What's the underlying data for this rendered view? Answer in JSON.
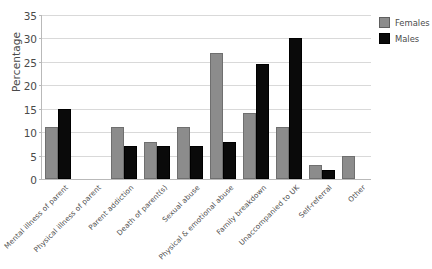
{
  "chart_data": {
    "type": "bar",
    "title": "",
    "xlabel": "",
    "ylabel": "Percentage",
    "ylim": [
      0,
      35
    ],
    "yticks": [
      0,
      5,
      10,
      15,
      20,
      25,
      30,
      35
    ],
    "grid": true,
    "legend_position": "right",
    "categories": [
      "Mental illness of parent",
      "Physical illness of parent",
      "Parent addiction",
      "Death of parent(s)",
      "Sexual abuse",
      "Physical & emotional abuse",
      "Family breakdown",
      "Unaccompanied to UK",
      "Self-referral",
      "Other"
    ],
    "series": [
      {
        "name": "Females",
        "color": "#8c8c8c",
        "values": [
          11,
          0,
          11,
          8,
          11,
          27,
          14,
          11,
          3,
          5
        ]
      },
      {
        "name": "Males",
        "color": "#000000",
        "values": [
          15,
          0,
          7,
          7,
          7,
          8,
          24.5,
          30,
          2,
          0
        ]
      }
    ]
  },
  "legend": {
    "items": [
      {
        "label": "Females",
        "swatch": "females-swatch"
      },
      {
        "label": "Males",
        "swatch": "males-swatch"
      }
    ]
  }
}
